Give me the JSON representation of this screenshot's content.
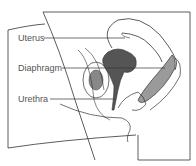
{
  "diagram": {
    "labels": [
      {
        "id": "uterus",
        "text": "Uterus"
      },
      {
        "id": "diaphragm",
        "text": "Diaphragm"
      },
      {
        "id": "urethra",
        "text": "Urethra"
      }
    ],
    "colors": {
      "stroke": "#333333",
      "fill_gray": "#9a9a9a",
      "diaphragm_fill": "#555555",
      "label_text": "#555555"
    }
  }
}
